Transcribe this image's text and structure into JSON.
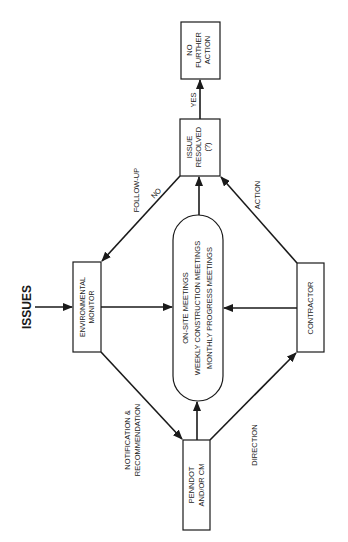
{
  "diagram": {
    "orientation": "rotated-90-ccw",
    "title_label": "ISSUES",
    "nodes": {
      "no_further_action": {
        "lines": [
          "NO",
          "FURTHER",
          "ACTION"
        ]
      },
      "issue_resolved": {
        "lines": [
          "ISSUE",
          "RESOLVED",
          "(?)"
        ]
      },
      "environmental_monitor": {
        "lines": [
          "ENVIRONMENTAL",
          "MONITOR"
        ]
      },
      "meetings": {
        "lines": [
          "ON-SITE MEETINGS",
          "WEEKLY CONSTRUCTION MEETINGS",
          "MONTHLY PROGRESS MEETINGS"
        ]
      },
      "contractor": {
        "lines": [
          "CONTRACTOR"
        ]
      },
      "penndot": {
        "lines": [
          "PENNDOT",
          "AND/OR CM"
        ]
      }
    },
    "edge_labels": {
      "yes": "YES",
      "no": "NO",
      "follow_up": "FOLLOW-UP",
      "action": "ACTION",
      "notification_1": "NOTIFICATION &",
      "notification_2": "RECOMMENDATION",
      "direction": "DIRECTION"
    },
    "edges": [
      {
        "from": "issues",
        "to": "environmental_monitor"
      },
      {
        "from": "environmental_monitor",
        "to": "meetings"
      },
      {
        "from": "environmental_monitor",
        "to": "penndot",
        "label": "NOTIFICATION & RECOMMENDATION"
      },
      {
        "from": "penndot",
        "to": "meetings"
      },
      {
        "from": "penndot",
        "to": "contractor",
        "label": "DIRECTION"
      },
      {
        "from": "contractor",
        "to": "meetings"
      },
      {
        "from": "contractor",
        "to": "issue_resolved",
        "label": "ACTION"
      },
      {
        "from": "meetings",
        "to": "issue_resolved"
      },
      {
        "from": "issue_resolved",
        "to": "no_further_action",
        "label": "YES"
      },
      {
        "from": "issue_resolved",
        "to": "environmental_monitor",
        "label": "NO / FOLLOW-UP"
      }
    ],
    "colors": {
      "stroke": "#1a1a1a",
      "background": "#ffffff"
    }
  }
}
